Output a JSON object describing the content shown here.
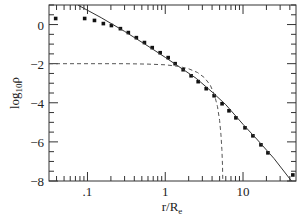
{
  "chart_data": {
    "type": "line",
    "title": "",
    "xlabel": "r/R_e",
    "ylabel": "log10 ρ",
    "xscale": "log",
    "xlim": [
      0.032,
      48
    ],
    "ylim": [
      -8,
      1.0
    ],
    "grid": false,
    "legend": null,
    "x_ticks_major": [
      {
        "value": 0.1,
        "label": ".1"
      },
      {
        "value": 1,
        "label": "1"
      },
      {
        "value": 10,
        "label": "10"
      }
    ],
    "y_ticks_major": [
      {
        "value": 0,
        "label": "0"
      },
      {
        "value": -2,
        "label": "−2"
      },
      {
        "value": -4,
        "label": "−4"
      },
      {
        "value": -6,
        "label": "−6"
      },
      {
        "value": -8,
        "label": "−8"
      }
    ],
    "series": [
      {
        "name": "data",
        "style": "markers",
        "marker": "square",
        "color": "#111111",
        "x": [
          0.039,
          0.092,
          0.123,
          0.16,
          0.203,
          0.265,
          0.335,
          0.425,
          0.54,
          0.68,
          0.86,
          1.09,
          1.34,
          1.7,
          2.15,
          2.65,
          3.36,
          4.25,
          5.38,
          6.6,
          8.1,
          10.6,
          13.4,
          17.0,
          20.9,
          43.7
        ],
        "y": [
          0.31,
          0.31,
          0.21,
          0.05,
          -0.05,
          -0.21,
          -0.41,
          -0.67,
          -0.92,
          -1.18,
          -1.44,
          -1.69,
          -2.0,
          -2.31,
          -2.62,
          -2.92,
          -3.28,
          -3.64,
          -4.05,
          -4.41,
          -4.77,
          -5.28,
          -5.69,
          -6.15,
          -6.56,
          -7.69
        ]
      },
      {
        "name": "model (solid)",
        "style": "solid",
        "color": "#333333",
        "x": [
          0.075,
          0.15,
          0.3,
          0.6,
          1.0,
          1.5,
          2.5,
          4.0,
          6.0,
          10.0,
          15.0,
          25.0,
          42.0
        ],
        "y": [
          1.0,
          0.35,
          -0.35,
          -1.1,
          -1.68,
          -2.15,
          -2.75,
          -3.45,
          -4.1,
          -5.1,
          -5.85,
          -6.85,
          -8.0
        ]
      },
      {
        "name": "model (dashed)",
        "style": "dashed",
        "color": "#555555",
        "x": [
          0.032,
          0.3,
          0.6,
          1.0,
          1.5,
          2.0,
          2.6,
          3.2,
          3.8,
          4.3,
          4.7,
          5.0,
          5.2,
          5.35,
          5.45,
          5.5
        ],
        "y": [
          -2.0,
          -2.0,
          -2.02,
          -2.06,
          -2.14,
          -2.26,
          -2.45,
          -2.72,
          -3.1,
          -3.6,
          -4.2,
          -4.9,
          -5.6,
          -6.4,
          -7.2,
          -8.0
        ]
      }
    ]
  }
}
